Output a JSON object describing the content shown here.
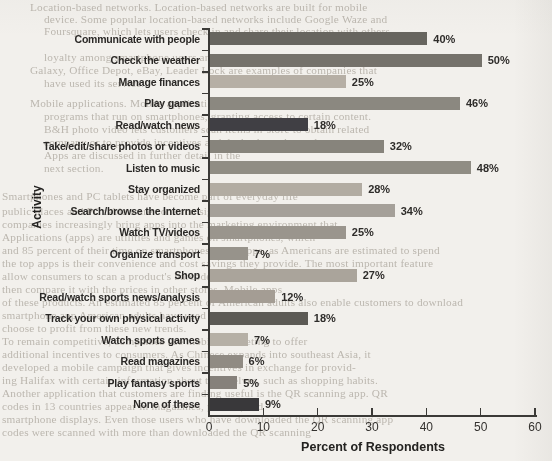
{
  "chart_data": {
    "type": "bar",
    "orientation": "horizontal",
    "title": "",
    "xlabel": "Percent of Respondents",
    "ylabel": "Activity",
    "xlim": [
      0,
      60
    ],
    "xticks": [
      0,
      10,
      20,
      30,
      40,
      50,
      60
    ],
    "grid": false,
    "legend": "none",
    "value_suffix": "%",
    "categories": [
      "Communicate with people",
      "Check the weather",
      "Manage finances",
      "Play games",
      "Read/watch news",
      "Take/edit/share photos or videos",
      "Listen to music",
      "Stay organized",
      "Search/browse the Internet",
      "Watch TV/videos",
      "Organize transport",
      "Shop",
      "Read/watch sports news/analysis",
      "Track your own physical activity",
      "Watch sports games",
      "Read magazines",
      "Play fantasy sports",
      "None of these"
    ],
    "values": [
      40,
      50,
      25,
      46,
      18,
      32,
      48,
      28,
      34,
      25,
      7,
      27,
      12,
      18,
      7,
      6,
      5,
      9
    ],
    "bar_colors": [
      "#67655f",
      "#75726b",
      "#b6afa5",
      "#8b8880",
      "#403f44",
      "#87847c",
      "#908d84",
      "#b2aca2",
      "#a5a099",
      "#9a958d",
      "#97938b",
      "#aaa49b",
      "#a49d94",
      "#5c5a55",
      "#b6b0a6",
      "#908b83",
      "#86817b",
      "#39383a"
    ],
    "axis_color": "#3b3a37"
  },
  "background_text": {
    "lines": [
      {
        "x": 30,
        "y": 1,
        "text": "Location-based networks. Location-based networks are built for mobile"
      },
      {
        "x": 44,
        "y": 13,
        "text": "device. Some popular location-based networks include Google Waze and"
      },
      {
        "x": 44,
        "y": 25,
        "text": "Foursquare, which lets users check in and share their location with others."
      },
      {
        "x": 44,
        "y": 51,
        "text": "loyalty among smartphone users and device makers, Samsung"
      },
      {
        "x": 30,
        "y": 64,
        "text": "Galaxy, Office Depot, eBay, Leader Lock are examples of companies that"
      },
      {
        "x": 44,
        "y": 77,
        "text": "have used its service."
      },
      {
        "x": 30,
        "y": 97,
        "text": "Mobile applications. Mobile applications (apps) are software"
      },
      {
        "x": 44,
        "y": 110,
        "text": "programs that run on smartphones, granting access to certain content."
      },
      {
        "x": 44,
        "y": 123,
        "text": "B&H photo video lets customers scan items in-store to obtain related"
      },
      {
        "x": 44,
        "y": 136,
        "text": "company or to provide incentives and deals about themselves."
      },
      {
        "x": 44,
        "y": 149,
        "text": "Apps are discussed in further detail in the"
      },
      {
        "x": 44,
        "y": 162,
        "text": "next section."
      },
      {
        "x": 2,
        "y": 190,
        "text": "Smartphones and PC tablets have become part of everyday life"
      },
      {
        "x": 2,
        "y": 205,
        "text": "public places and PC tablets are common sights in airports and"
      },
      {
        "x": 2,
        "y": 218,
        "text": "companies increasingly bring apps into the marketing environment that"
      },
      {
        "x": 2,
        "y": 231,
        "text": "Applications (apps) are utilities and games on smartphones, which"
      },
      {
        "x": 2,
        "y": 244,
        "text": "and 85 percent of their time on smartphones using apps, as Americans are estimated to spend"
      },
      {
        "x": 2,
        "y": 257,
        "text": "the top apps is their convenience and cost savings they provide. The most important feature"
      },
      {
        "x": 2,
        "y": 270,
        "text": "allow consumers to scan a product's barcode and other to the customer"
      },
      {
        "x": 2,
        "y": 283,
        "text": "then compare it with the prices in other stores. Mobile apps"
      },
      {
        "x": 2,
        "y": 296,
        "text": "of these products. An estimated 85 percent of American adults also enable customers to download"
      },
      {
        "x": 2,
        "y": 309,
        "text": "smartphone app American adults have used that on the"
      },
      {
        "x": 2,
        "y": 322,
        "text": "choose to profit from these new trends."
      },
      {
        "x": 2,
        "y": 335,
        "text": "To remain competitive, companies use mobile marketing to offer"
      },
      {
        "x": 2,
        "y": 348,
        "text": "additional incentives to consumers. As Chinese expands into southeast Asia, it"
      },
      {
        "x": 2,
        "y": 361,
        "text": "developed a mobile campaign that gives incentives in exchange for provid-"
      },
      {
        "x": 2,
        "y": 374,
        "text": "ing Halifax with certain information about themselves, such as shopping habits."
      },
      {
        "x": 2,
        "y": 387,
        "text": "Another application that customers are finding useful is the QR scanning app. QR"
      },
      {
        "x": 2,
        "y": 400,
        "text": "codes in 13 countries appear in magazines, posters, and"
      },
      {
        "x": 2,
        "y": 413,
        "text": "smartphone displays. Even those users who have downloaded the QR scanning app"
      },
      {
        "x": 2,
        "y": 426,
        "text": "codes were scanned with more than downloaded the QR scanning"
      }
    ]
  },
  "colors": {
    "paper": "#f2f0ec",
    "label_text": "#2a2826",
    "axis": "#3b3a37",
    "bleed_text": "#8f887d"
  }
}
